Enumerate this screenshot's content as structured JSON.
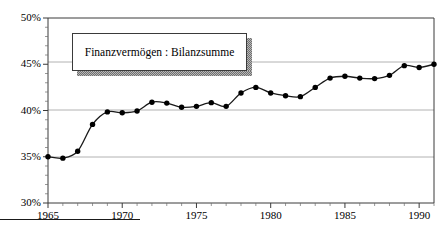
{
  "chart_data": {
    "type": "line",
    "title": "",
    "subtitle": "",
    "xlabel": "",
    "ylabel": "",
    "legend": [
      "Finanzvermögen : Bilanzsumme"
    ],
    "legend_position": "inside-top-left",
    "grid": true,
    "grid_lines_y": [
      35,
      40,
      45
    ],
    "xlim": [
      1965,
      1991
    ],
    "ylim": [
      30,
      50
    ],
    "ytick_labels": [
      "30%",
      "35%",
      "40%",
      "45%",
      "50%"
    ],
    "ytick_values": [
      30,
      35,
      40,
      45,
      50
    ],
    "xtick_labels": [
      "1965",
      "1970",
      "1975",
      "1980",
      "1985",
      "1990"
    ],
    "xtick_values": [
      1965,
      1970,
      1975,
      1980,
      1985,
      1990
    ],
    "x_minor_ticks": [
      1966,
      1967,
      1968,
      1969,
      1971,
      1972,
      1973,
      1974,
      1976,
      1977,
      1978,
      1979,
      1981,
      1982,
      1983,
      1984,
      1986,
      1987,
      1988,
      1989,
      1991
    ],
    "marker": "filled-circle",
    "line_color": "#1a1a1a",
    "marker_color": "#000000",
    "x": [
      1965,
      1966,
      1967,
      1968,
      1969,
      1970,
      1971,
      1972,
      1973,
      1974,
      1975,
      1976,
      1977,
      1978,
      1979,
      1980,
      1981,
      1982,
      1983,
      1984,
      1985,
      1986,
      1987,
      1988,
      1989,
      1990,
      1991
    ],
    "series": [
      {
        "name": "Finanzvermögen : Bilanzsumme",
        "values": [
          35.0,
          34.85,
          35.6,
          38.5,
          39.85,
          39.75,
          39.95,
          40.9,
          40.8,
          40.35,
          40.45,
          40.85,
          40.45,
          41.9,
          42.5,
          41.9,
          41.6,
          41.5,
          42.5,
          43.5,
          43.7,
          43.5,
          43.45,
          43.8,
          44.85,
          44.65,
          45.0
        ]
      }
    ]
  },
  "legend": {
    "label": "Finanzvermögen : Bilanzsumme"
  },
  "axes": {
    "y_labels": [
      "50%",
      "45%",
      "40%",
      "35%",
      "30%"
    ],
    "x_labels": [
      "1965",
      "1970",
      "1975",
      "1980",
      "1985",
      "1990"
    ]
  },
  "colors": {
    "line": "#1a1a1a",
    "marker": "#000000",
    "grid": "#9a9a9a",
    "axis": "#3a3a3a",
    "background": "#ffffff",
    "legend_shadow": "#8a8a8a"
  }
}
